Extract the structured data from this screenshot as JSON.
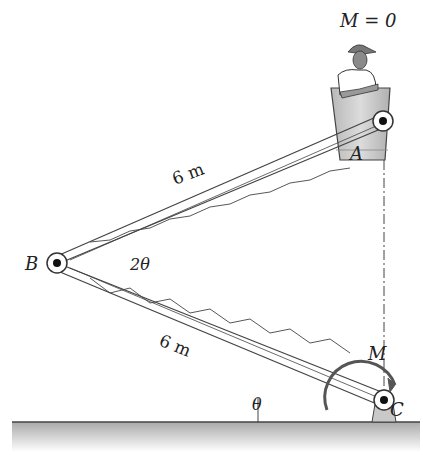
{
  "title_equation": "M = 0",
  "labels": {
    "point_a": "A",
    "point_b": "B",
    "point_c": "C",
    "moment": "M",
    "angle_b": "2θ",
    "angle_c": "θ",
    "upper_length": "6 m",
    "lower_length": "6 m"
  },
  "colors": {
    "ground": "#bdbdbd",
    "bucket": "#c8c8c8",
    "line": "#333333"
  }
}
